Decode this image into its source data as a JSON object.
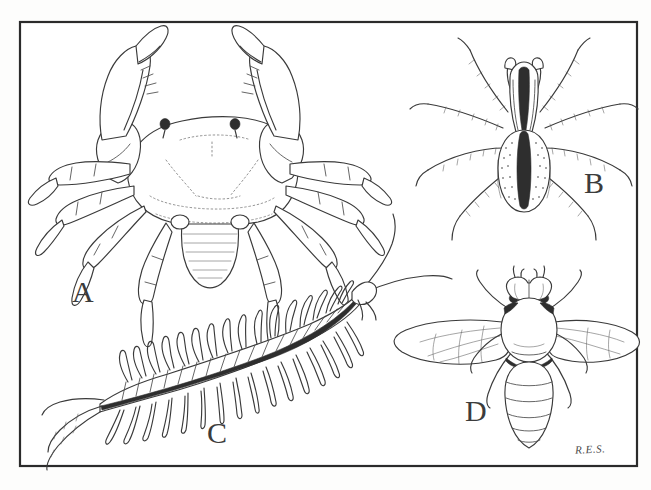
{
  "figure": {
    "background_color": "#fdfdfc",
    "ink_color": "#3a3a3a",
    "frame_color": "#2b2b2b",
    "frame": {
      "x": 20,
      "y": 22,
      "width": 617,
      "height": 444
    },
    "signature": "R.E.S.",
    "panels": [
      {
        "key": "A",
        "label": "A",
        "subject": "crab",
        "group": "Crustacea",
        "position": "top-left",
        "features": "broad carapace with two stalked eyes, two large raised chelae (pincers), eight walking legs, segmented abdominal flap folded beneath",
        "leg_pairs": 5,
        "antennae": 0,
        "body_regions": 2,
        "wings": 0,
        "label_x": 72,
        "label_y": 277
      },
      {
        "key": "B",
        "label": "B",
        "subject": "spider",
        "group": "Arachnida",
        "position": "top-right",
        "features": "speckled oval abdomen with a dark median stripe, striped cephalothorax, eight long hairy legs, short pedipalps",
        "leg_pairs": 4,
        "antennae": 0,
        "body_regions": 2,
        "wings": 0,
        "label_x": 584,
        "label_y": 168
      },
      {
        "key": "C",
        "label": "C",
        "subject": "centipede",
        "group": "Chilopoda",
        "position": "bottom-left",
        "features": "long flattened body of many similar segments, one pair of legs per segment, a pair of long antennae and trailing terminal legs",
        "leg_pairs": 21,
        "antennae": 2,
        "body_regions": 2,
        "wings": 0,
        "label_x": 207,
        "label_y": 418
      },
      {
        "key": "D",
        "label": "D",
        "subject": "fly",
        "group": "Insecta",
        "position": "bottom-right",
        "features": "large compound eyes, rounded thorax, two veined membranous wings spread sideways, banded tapering abdomen, six legs",
        "leg_pairs": 3,
        "antennae": 2,
        "body_regions": 3,
        "wings": 2,
        "label_x": 465,
        "label_y": 396
      }
    ]
  }
}
